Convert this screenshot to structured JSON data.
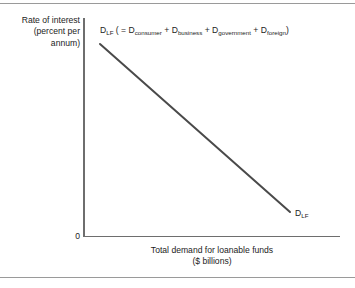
{
  "figure": {
    "background_color": "#ffffff",
    "rule_color": "#9a9a9a",
    "axis_color": "#6e6e6e",
    "curve_color": "#4a4a4a",
    "text_color": "#1c1c1c"
  },
  "axes": {
    "y_label": "Rate of interest\n(percent per\nannum)",
    "x_label": "Total demand for loanable funds\n($ billions)",
    "origin_label": "0"
  },
  "curve": {
    "equation_prefix": "D",
    "equation_prefix_sub": "LF",
    "equation_open": " ( = D",
    "term1_sub": "consumer",
    "plus1": " + D",
    "term2_sub": "business",
    "plus2": " + D",
    "term3_sub": "government",
    "plus3": " + D",
    "term4_sub": "foreign",
    "equation_close": ")",
    "end_label": "D",
    "end_label_sub": "LF"
  },
  "chart_data": {
    "type": "line",
    "title": "",
    "subtitle": "",
    "xlabel": "Total demand for loanable funds ($ billions)",
    "ylabel": "Rate of interest (percent per annum)",
    "grid": false,
    "legend_position": "inline-annotation",
    "xlim": [
      0,
      100
    ],
    "ylim": [
      0,
      100
    ],
    "x_ticks": [],
    "y_ticks": [],
    "tick_labels": [
      "0"
    ],
    "annotations": [
      {
        "text": "D_LF ( = D_consumer + D_business + D_government + D_foreign)",
        "position": "above-left",
        "x": 8,
        "y": 97
      },
      {
        "text": "D_LF",
        "position": "curve-end",
        "x": 83,
        "y": 9
      }
    ],
    "series": [
      {
        "name": "D_LF",
        "label": "Demand for loanable funds",
        "color": "#4a4a4a",
        "linewidth": 2,
        "x": [
          6.6,
          80.5
        ],
        "values": [
          88.1,
          10.9
        ],
        "points": [
          {
            "x": 6.6,
            "y": 88.1
          },
          {
            "x": 80.5,
            "y": 10.9
          }
        ],
        "description": "Downward sloping straight-line demand curve for loanable funds"
      }
    ]
  }
}
